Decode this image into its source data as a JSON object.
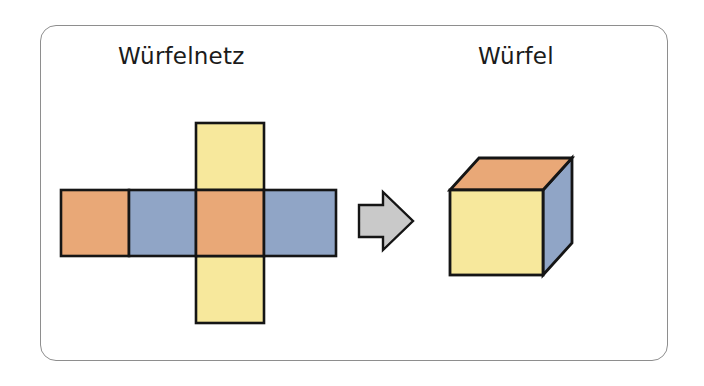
{
  "page": {
    "background_color": "#ffffff"
  },
  "panel": {
    "border_color": "#8e8e8e",
    "fill_color": "#ffffff",
    "corner_radius": "16px"
  },
  "captions": {
    "net": "Würfelnetz",
    "cube": "Würfel"
  },
  "palette": {
    "orange": "#e9a877",
    "blue": "#90a5c6",
    "yellow": "#f7e89c",
    "arrow_gray": "#c9c9c9",
    "outline": "#151515"
  },
  "net": {
    "label": "Würfelnetz",
    "shape": "cross",
    "face_count": 6,
    "faces": [
      {
        "name": "net-face-top",
        "position": "top",
        "color": "#f7e89c",
        "color_name": "yellow"
      },
      {
        "name": "net-face-left",
        "position": "row-left",
        "color": "#e9a877",
        "color_name": "orange"
      },
      {
        "name": "net-face-center-left",
        "position": "row-center-left",
        "color": "#90a5c6",
        "color_name": "blue"
      },
      {
        "name": "net-face-center",
        "position": "row-center",
        "color": "#e9a877",
        "color_name": "orange"
      },
      {
        "name": "net-face-right",
        "position": "row-right",
        "color": "#90a5c6",
        "color_name": "blue"
      },
      {
        "name": "net-face-bottom",
        "position": "bottom",
        "color": "#f7e89c",
        "color_name": "yellow"
      }
    ]
  },
  "arrow": {
    "name": "transform-arrow",
    "direction": "right",
    "fill": "#c9c9c9",
    "outline": "#151515"
  },
  "cube": {
    "label": "Würfel",
    "faces": [
      {
        "name": "cube-face-front",
        "position": "front",
        "color": "#f7e89c",
        "color_name": "yellow"
      },
      {
        "name": "cube-face-top",
        "position": "top",
        "color": "#e9a877",
        "color_name": "orange"
      },
      {
        "name": "cube-face-right",
        "position": "right",
        "color": "#90a5c6",
        "color_name": "blue"
      }
    ]
  }
}
